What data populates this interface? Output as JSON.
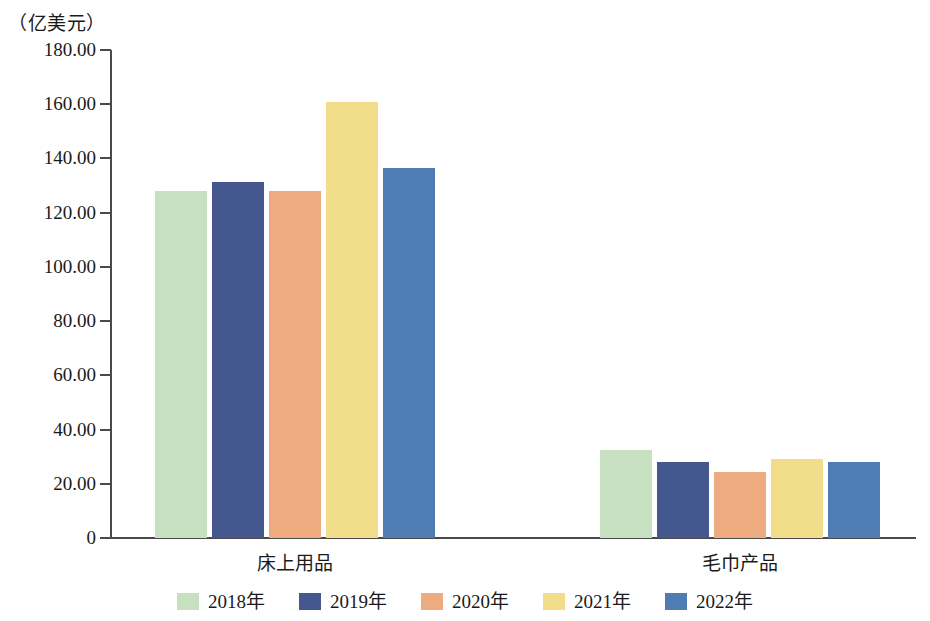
{
  "chart_data": {
    "type": "bar",
    "title": "",
    "subtitle": "",
    "unit_caption": "（亿美元）",
    "xlabel": "",
    "ylabel": "亿美元",
    "categories": [
      "床上用品",
      "毛巾产品"
    ],
    "series": [
      {
        "name": "2018年",
        "color": "#c6e0c0",
        "values": [
          128.0,
          32.3
        ]
      },
      {
        "name": "2019年",
        "color": "#44588f",
        "values": [
          131.3,
          28.2
        ]
      },
      {
        "name": "2020年",
        "color": "#eeab80",
        "values": [
          128.0,
          24.3
        ]
      },
      {
        "name": "2021年",
        "color": "#f2dd8b",
        "values": [
          160.8,
          29.0
        ]
      },
      {
        "name": "2022年",
        "color": "#4f7db3",
        "values": [
          136.5,
          27.9
        ]
      }
    ],
    "ylim": [
      0,
      180
    ],
    "ytick_labels": [
      "180.00",
      "160.00",
      "140.00",
      "120.00",
      "100.00",
      "80.00",
      "60.00",
      "40.00",
      "20.00",
      "0"
    ],
    "ytick_values": [
      180,
      160,
      140,
      120,
      100,
      80,
      60,
      40,
      20,
      0
    ],
    "grid": false,
    "legend_position": "bottom",
    "axis_color": "#4a4a4a"
  }
}
